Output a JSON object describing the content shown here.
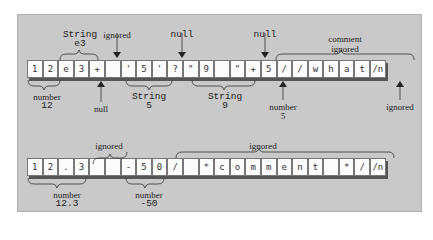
{
  "diagram": {
    "row1": {
      "cells": [
        "1",
        "2",
        "e",
        "3",
        "+",
        " ",
        "'",
        "5",
        "'",
        "?",
        "\"",
        "9",
        " ",
        "\"",
        "+",
        "5",
        "/",
        "/",
        "w",
        "h",
        "a",
        "t",
        "/n"
      ],
      "annotations": {
        "string_e3_type": "String",
        "string_e3_value": "e3",
        "ignored_space": "ignored",
        "null_question": "null",
        "null_plus": "null",
        "comment_type": "comment",
        "comment_value": "ignored",
        "number12_type": "number",
        "number12_value": "12",
        "null_plus1": "null",
        "string5_type": "String",
        "string5_value": "5",
        "string9_type": "String",
        "string9_value": "9",
        "number5_type": "number",
        "number5_value": "5",
        "ignored_newline": "ignored"
      }
    },
    "row2": {
      "cells": [
        "1",
        "2",
        ".",
        "3",
        " ",
        " ",
        "-",
        "5",
        "0",
        "/",
        " ",
        "*",
        "c",
        "o",
        "m",
        "m",
        "e",
        "n",
        "t",
        " ",
        "*",
        "/",
        "/n"
      ],
      "annotations": {
        "ignored_spaces": "ignored",
        "ignored_comment": "ignored",
        "number123_type": "number",
        "number123_value": "12.3",
        "number50_type": "number",
        "number50_value": "-50"
      }
    }
  }
}
